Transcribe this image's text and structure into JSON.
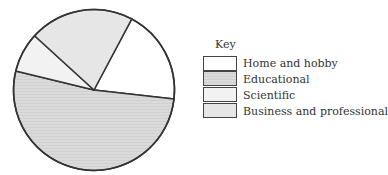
{
  "chart_data": {
    "type": "pie",
    "title": "",
    "legend_title": "Key",
    "legend_position": "right",
    "start_angle_deg": 28,
    "direction": "clockwise",
    "categories": [
      "Home and hobby",
      "Educational",
      "Scientific",
      "Business and professional"
    ],
    "values": [
      19,
      52,
      8,
      21
    ],
    "colors": [
      "#ffffff",
      "#d9d9d9",
      "#f2f2f2",
      "#e6e6e6"
    ]
  },
  "legend": {
    "title": "Key",
    "items": [
      {
        "label": "Home and hobby",
        "color": "#ffffff"
      },
      {
        "label": "Educational",
        "color": "#d9d9d9"
      },
      {
        "label": "Scientific",
        "color": "#f2f2f2"
      },
      {
        "label": "Business and professional",
        "color": "#e6e6e6"
      }
    ]
  }
}
